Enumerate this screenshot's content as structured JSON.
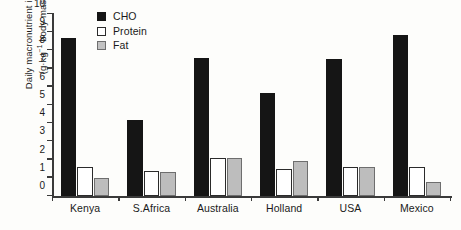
{
  "chart_data": {
    "type": "bar",
    "title": "",
    "xlabel": "",
    "ylabel": "Daily macronutrient intake (g·kg⁻¹ body mass)",
    "ylabel_line1": "Daily macronutrient intake",
    "ylabel_line2_prefix": "(g·kg",
    "ylabel_line2_sup": "−1",
    "ylabel_line2_suffix": " body mass)",
    "ylim": [
      0,
      10
    ],
    "ytick_values": [
      0,
      1,
      2,
      3,
      4,
      5,
      6,
      7,
      8,
      9,
      10
    ],
    "ytick_labels": [
      "0",
      "1",
      "2",
      "3",
      "4",
      "5",
      "6",
      "7",
      "8",
      "9",
      "10"
    ],
    "grid": false,
    "legend_position": "top-left-inside",
    "categories": [
      "Kenya",
      "S.Africa",
      "Australia",
      "Holland",
      "USA",
      "Mexico"
    ],
    "series": [
      {
        "name": "CHO",
        "color": "#151515",
        "values": [
          8.7,
          4.2,
          7.6,
          5.65,
          7.55,
          8.85
        ]
      },
      {
        "name": "Protein",
        "color": "#ffffff",
        "values": [
          1.6,
          1.4,
          2.1,
          1.5,
          1.6,
          1.6
        ]
      },
      {
        "name": "Fat",
        "color": "#bdbdbd",
        "values": [
          1.0,
          1.3,
          2.1,
          1.9,
          1.6,
          0.75
        ]
      }
    ]
  },
  "legend": {
    "items": [
      {
        "label": "CHO",
        "swatch": "cho"
      },
      {
        "label": "Protein",
        "swatch": "protein"
      },
      {
        "label": "Fat",
        "swatch": "fat"
      }
    ]
  }
}
